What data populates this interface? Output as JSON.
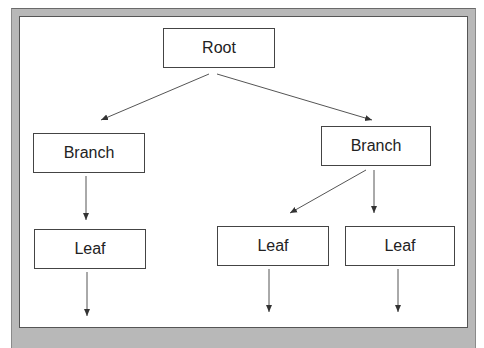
{
  "diagram": {
    "type": "tree",
    "colors": {
      "frame": "#b8b8b8",
      "background": "#ffffff",
      "stroke": "#444444",
      "text": "#222222"
    },
    "nodes": [
      {
        "id": "root",
        "label": "Root",
        "x": 163,
        "y": 28,
        "w": 112,
        "h": 40
      },
      {
        "id": "branch-left",
        "label": "Branch",
        "x": 33,
        "y": 133,
        "w": 112,
        "h": 40
      },
      {
        "id": "branch-right",
        "label": "Branch",
        "x": 321,
        "y": 126,
        "w": 110,
        "h": 40
      },
      {
        "id": "leaf-left",
        "label": "Leaf",
        "x": 34,
        "y": 229,
        "w": 112,
        "h": 40
      },
      {
        "id": "leaf-middle",
        "label": "Leaf",
        "x": 217,
        "y": 226,
        "w": 112,
        "h": 40
      },
      {
        "id": "leaf-right",
        "label": "Leaf",
        "x": 345,
        "y": 226,
        "w": 110,
        "h": 40
      }
    ],
    "edges": [
      {
        "from": "root",
        "to": "branch-left",
        "x1": 209,
        "y1": 74,
        "x2": 101,
        "y2": 120
      },
      {
        "from": "root",
        "to": "branch-right",
        "x1": 217,
        "y1": 74,
        "x2": 372,
        "y2": 120
      },
      {
        "from": "branch-left",
        "to": "leaf-left",
        "x1": 86,
        "y1": 176,
        "x2": 86,
        "y2": 220
      },
      {
        "from": "branch-right",
        "to": "leaf-middle",
        "x1": 366,
        "y1": 170,
        "x2": 290,
        "y2": 213
      },
      {
        "from": "branch-right",
        "to": "leaf-right",
        "x1": 374,
        "y1": 170,
        "x2": 374,
        "y2": 213
      },
      {
        "from": "leaf-left",
        "to": "outside",
        "x1": 87,
        "y1": 272,
        "x2": 87,
        "y2": 316
      },
      {
        "from": "leaf-middle",
        "to": "outside",
        "x1": 269,
        "y1": 269,
        "x2": 269,
        "y2": 312
      },
      {
        "from": "leaf-right",
        "to": "outside",
        "x1": 398,
        "y1": 269,
        "x2": 398,
        "y2": 312
      }
    ]
  }
}
